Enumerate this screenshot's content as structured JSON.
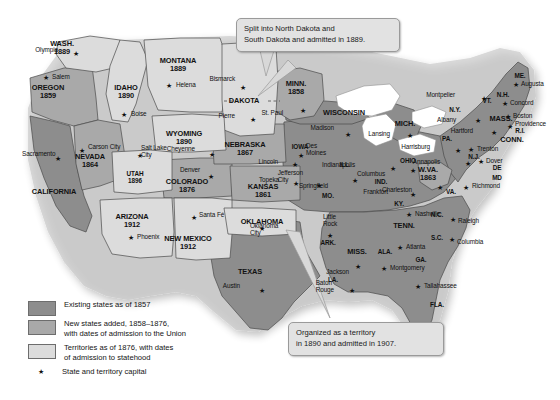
{
  "map": {
    "title": "Growth of the United States, 1857-1876",
    "colors": {
      "existing_state": "#8d8d8d",
      "new_state": "#a9a9a9",
      "territory": "#dcdcdc",
      "water": "#ffffff",
      "border": "#4a4a4a",
      "callout_bg": "#e2e2e2",
      "callout_border": "#9a9a9a",
      "text": "#111111"
    }
  },
  "legend": {
    "items": [
      {
        "swatch": "existing-state-swatch",
        "color": "#8d8d8d",
        "label": "Existing states as of 1857"
      },
      {
        "swatch": "new-state-swatch",
        "color": "#a9a9a9",
        "label": "New states added, 1858–1876,\nwith dates of admission to the Union"
      },
      {
        "swatch": "territory-swatch",
        "color": "#dcdcdc",
        "label": "Territories as of 1876, with dates\nof admission to statehood"
      }
    ],
    "capital": {
      "icon": "star-icon",
      "label": "State and territory capital"
    }
  },
  "callouts": [
    {
      "id": "dakota-callout",
      "text": "Split into North Dakota and\nSouth Dakota and admitted in 1889."
    },
    {
      "id": "oklahoma-callout",
      "text": "Organized as a territory\nin 1890 and admitted in 1907."
    }
  ],
  "states": [
    {
      "name": "WASH.",
      "date": "1889",
      "class": "territory",
      "x": 62,
      "y": 48
    },
    {
      "name": "OREGON",
      "date": "1859",
      "class": "new",
      "x": 48,
      "y": 92
    },
    {
      "name": "IDAHO",
      "date": "1890",
      "class": "territory",
      "x": 126,
      "y": 92
    },
    {
      "name": "MONTANA",
      "date": "1889",
      "class": "territory",
      "x": 178,
      "y": 65
    },
    {
      "name": "DAKOTA",
      "date": "",
      "class": "territory",
      "x": 244,
      "y": 101
    },
    {
      "name": "MINN.",
      "date": "1858",
      "class": "new",
      "x": 296,
      "y": 88
    },
    {
      "name": "WISCONSIN",
      "date": "",
      "class": "existing",
      "x": 344,
      "y": 113
    },
    {
      "name": "MICH.",
      "date": "",
      "class": "existing",
      "x": 405,
      "y": 124
    },
    {
      "name": "WYOMING",
      "date": "1890",
      "class": "territory",
      "x": 184,
      "y": 138
    },
    {
      "name": "NEBRASKA",
      "date": "1867",
      "class": "new",
      "x": 245,
      "y": 149
    },
    {
      "name": "IOWA",
      "date": "",
      "class": "existing",
      "x": 300,
      "y": 147
    },
    {
      "name": "ILL.",
      "date": "",
      "class": "existing",
      "x": 345,
      "y": 165
    },
    {
      "name": "IND.",
      "date": "",
      "class": "existing",
      "x": 381,
      "y": 182
    },
    {
      "name": "OHIO",
      "date": "",
      "class": "existing",
      "x": 408,
      "y": 161
    },
    {
      "name": "PA.",
      "date": "",
      "class": "existing",
      "x": 447,
      "y": 139
    },
    {
      "name": "N.Y.",
      "date": "",
      "class": "existing",
      "x": 455,
      "y": 110
    },
    {
      "name": "VT.",
      "date": "",
      "class": "existing",
      "x": 487,
      "y": 101
    },
    {
      "name": "N.H.",
      "date": "",
      "class": "existing",
      "x": 503,
      "y": 95
    },
    {
      "name": "ME.",
      "date": "",
      "class": "existing",
      "x": 520,
      "y": 76
    },
    {
      "name": "MASS.",
      "date": "",
      "class": "existing",
      "x": 501,
      "y": 119
    },
    {
      "name": "R.I.",
      "date": "",
      "class": "existing",
      "x": 520,
      "y": 131
    },
    {
      "name": "CONN.",
      "date": "",
      "class": "existing",
      "x": 512,
      "y": 140
    },
    {
      "name": "N.J.",
      "date": "",
      "class": "existing",
      "x": 474,
      "y": 157
    },
    {
      "name": "DE",
      "date": "",
      "class": "existing",
      "x": 497,
      "y": 168
    },
    {
      "name": "MD",
      "date": "",
      "class": "existing",
      "x": 497,
      "y": 178
    },
    {
      "name": "W.VA.",
      "date": "1863",
      "class": "new",
      "x": 428,
      "y": 174
    },
    {
      "name": "VA.",
      "date": "",
      "class": "existing",
      "x": 451,
      "y": 192
    },
    {
      "name": "KY.",
      "date": "",
      "class": "existing",
      "x": 399,
      "y": 204
    },
    {
      "name": "TENN.",
      "date": "",
      "class": "existing",
      "x": 404,
      "y": 226
    },
    {
      "name": "N.C.",
      "date": "",
      "class": "existing",
      "x": 437,
      "y": 215
    },
    {
      "name": "S.C.",
      "date": "",
      "class": "existing",
      "x": 437,
      "y": 238
    },
    {
      "name": "GA.",
      "date": "",
      "class": "existing",
      "x": 421,
      "y": 260
    },
    {
      "name": "FLA.",
      "date": "",
      "class": "existing",
      "x": 437,
      "y": 305
    },
    {
      "name": "ALA.",
      "date": "",
      "class": "existing",
      "x": 385,
      "y": 252
    },
    {
      "name": "MISS.",
      "date": "",
      "class": "existing",
      "x": 357,
      "y": 252
    },
    {
      "name": "LA.",
      "date": "",
      "class": "existing",
      "x": 333,
      "y": 280
    },
    {
      "name": "ARK.",
      "date": "",
      "class": "existing",
      "x": 328,
      "y": 243
    },
    {
      "name": "MO.",
      "date": "",
      "class": "existing",
      "x": 328,
      "y": 196
    },
    {
      "name": "KANSAS",
      "date": "1861",
      "class": "new",
      "x": 263,
      "y": 191
    },
    {
      "name": "OKLAHOMA",
      "date": "",
      "class": "territory",
      "x": 262,
      "y": 222
    },
    {
      "name": "TEXAS",
      "date": "",
      "class": "existing",
      "x": 250,
      "y": 272
    },
    {
      "name": "COLORADO",
      "date": "1876",
      "class": "new",
      "x": 187,
      "y": 186
    },
    {
      "name": "UTAH",
      "date": "1896",
      "class": "territory",
      "x": 135,
      "y": 178
    },
    {
      "name": "NEVADA",
      "date": "1864",
      "class": "new",
      "x": 90,
      "y": 161
    },
    {
      "name": "CALIFORNIA",
      "date": "",
      "class": "existing",
      "x": 54,
      "y": 192
    },
    {
      "name": "ARIZONA",
      "date": "1912",
      "class": "territory",
      "x": 132,
      "y": 221
    },
    {
      "name": "NEW MEXICO",
      "date": "1912",
      "class": "territory",
      "x": 188,
      "y": 243
    }
  ],
  "cities": [
    {
      "name": "Olympia",
      "x": 58,
      "y": 50,
      "sx": 76,
      "sy": 53,
      "align": "right"
    },
    {
      "name": "Salem",
      "x": 52,
      "y": 77,
      "sx": 46,
      "sy": 77,
      "align": "left"
    },
    {
      "name": "Boise",
      "x": 131,
      "y": 114,
      "sx": 124,
      "sy": 114,
      "align": "left"
    },
    {
      "name": "Helena",
      "x": 176,
      "y": 85,
      "sx": 169,
      "sy": 85,
      "align": "left"
    },
    {
      "name": "Bismarck",
      "x": 235,
      "y": 79,
      "sx": 243,
      "sy": 87,
      "align": "right"
    },
    {
      "name": "Pierre",
      "x": 235,
      "y": 116,
      "sx": 253,
      "sy": 119,
      "align": "right"
    },
    {
      "name": "St. Paul",
      "x": 283,
      "y": 113,
      "sx": 303,
      "sy": 110,
      "align": "right"
    },
    {
      "name": "Madison",
      "x": 334,
      "y": 128,
      "sx": 348,
      "sy": 134,
      "align": "right"
    },
    {
      "name": "Lansing",
      "x": 390,
      "y": 134,
      "sx": 410,
      "sy": 135,
      "align": "right"
    },
    {
      "name": "Des\nMoines",
      "x": 306,
      "y": 150,
      "sx": 301,
      "sy": 155,
      "align": "left"
    },
    {
      "name": "Springfield",
      "x": 328,
      "y": 186,
      "sx": 355,
      "sy": 180,
      "align": "right"
    },
    {
      "name": "Indianapolis",
      "x": 355,
      "y": 165,
      "sx": 393,
      "sy": 168,
      "align": "right"
    },
    {
      "name": "Columbus",
      "x": 385,
      "y": 174,
      "sx": 413,
      "sy": 170,
      "align": "right"
    },
    {
      "name": "Jefferson\nCity",
      "x": 303,
      "y": 177,
      "sx": 319,
      "sy": 185,
      "align": "right"
    },
    {
      "name": "Frankfort",
      "x": 388,
      "y": 192,
      "sx": 413,
      "sy": 194,
      "align": "right"
    },
    {
      "name": "Charleston",
      "x": 412,
      "y": 190,
      "sx": 440,
      "sy": 187,
      "align": "right"
    },
    {
      "name": "Harrisburg",
      "x": 430,
      "y": 147,
      "sx": 458,
      "sy": 150,
      "align": "right"
    },
    {
      "name": "Trenton",
      "x": 477,
      "y": 149,
      "sx": 471,
      "sy": 149,
      "align": "left"
    },
    {
      "name": "Dover",
      "x": 486,
      "y": 161,
      "sx": 481,
      "sy": 161,
      "align": "left"
    },
    {
      "name": "Annapolis",
      "x": 440,
      "y": 162,
      "sx": 468,
      "sy": 163,
      "align": "right"
    },
    {
      "name": "Richmond",
      "x": 472,
      "y": 186,
      "sx": 466,
      "sy": 187,
      "align": "left"
    },
    {
      "name": "Raleigh",
      "x": 458,
      "y": 221,
      "sx": 453,
      "sy": 219,
      "align": "left"
    },
    {
      "name": "Columbia",
      "x": 457,
      "y": 242,
      "sx": 452,
      "sy": 239,
      "align": "left"
    },
    {
      "name": "Atlanta",
      "x": 406,
      "y": 247,
      "sx": 400,
      "sy": 247,
      "align": "left"
    },
    {
      "name": "Tallahassee",
      "x": 424,
      "y": 286,
      "sx": 418,
      "sy": 286,
      "align": "left"
    },
    {
      "name": "Montgomery",
      "x": 390,
      "y": 268,
      "sx": 384,
      "sy": 268,
      "align": "left"
    },
    {
      "name": "Jackson",
      "x": 349,
      "y": 272,
      "sx": 358,
      "sy": 266,
      "align": "right"
    },
    {
      "name": "Baton\nRouge",
      "x": 334,
      "y": 287,
      "sx": 352,
      "sy": 290,
      "align": "right"
    },
    {
      "name": "Little\nRock",
      "x": 323,
      "y": 221,
      "sx": 330,
      "sy": 235,
      "align": "left"
    },
    {
      "name": "Nashville",
      "x": 415,
      "y": 214,
      "sx": 409,
      "sy": 214,
      "align": "left"
    },
    {
      "name": "Oklahoma\nCity",
      "x": 250,
      "y": 230,
      "sx": 262,
      "sy": 228,
      "align": "left"
    },
    {
      "name": "Austin",
      "x": 240,
      "y": 286,
      "sx": 262,
      "sy": 290,
      "align": "right"
    },
    {
      "name": "Santa Fé",
      "x": 199,
      "y": 215,
      "sx": 194,
      "sy": 217,
      "align": "left"
    },
    {
      "name": "Phoenix",
      "x": 137,
      "y": 237,
      "sx": 131,
      "sy": 237,
      "align": "left"
    },
    {
      "name": "Denver",
      "x": 200,
      "y": 170,
      "sx": 211,
      "sy": 176,
      "align": "right"
    },
    {
      "name": "Cheyenne",
      "x": 195,
      "y": 149,
      "sx": 212,
      "sy": 154,
      "align": "right"
    },
    {
      "name": "Salt Lake\nCity",
      "x": 141,
      "y": 152,
      "sx": 140,
      "sy": 155,
      "align": "left"
    },
    {
      "name": "Carson City",
      "x": 88,
      "y": 147,
      "sx": 82,
      "sy": 150,
      "align": "left"
    },
    {
      "name": "Sacramento",
      "x": 22,
      "y": 154,
      "sx": 58,
      "sy": 158,
      "align": "left"
    },
    {
      "name": "Topeka",
      "x": 279,
      "y": 180,
      "sx": 296,
      "sy": 183,
      "align": "right"
    },
    {
      "name": "Lincoln",
      "x": 278,
      "y": 162,
      "sx": 295,
      "sy": 164,
      "align": "right"
    },
    {
      "name": "Montpelier",
      "x": 455,
      "y": 95,
      "sx": 484,
      "sy": 98,
      "align": "right"
    },
    {
      "name": "Concord",
      "x": 510,
      "y": 103,
      "sx": 505,
      "sy": 103,
      "align": "left"
    },
    {
      "name": "Augusta",
      "x": 521,
      "y": 84,
      "sx": 516,
      "sy": 84,
      "align": "left"
    },
    {
      "name": "Boston",
      "x": 513,
      "y": 116,
      "sx": 508,
      "sy": 116,
      "align": "left"
    },
    {
      "name": "Providence",
      "x": 515,
      "y": 124,
      "sx": 510,
      "sy": 126,
      "align": "left"
    },
    {
      "name": "Hartford",
      "x": 473,
      "y": 131,
      "sx": 494,
      "sy": 132,
      "align": "right"
    },
    {
      "name": "Albany",
      "x": 456,
      "y": 120,
      "sx": 478,
      "sy": 120,
      "align": "right"
    }
  ]
}
